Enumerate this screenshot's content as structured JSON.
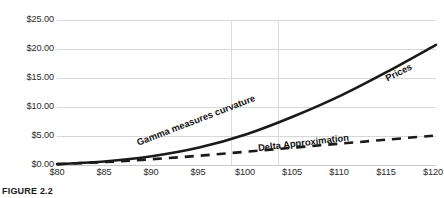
{
  "chart_data": {
    "type": "line",
    "title": "",
    "subtitle": "",
    "xlabel": "",
    "ylabel": "",
    "xlim": [
      80,
      120
    ],
    "ylim": [
      0,
      25
    ],
    "grid": true,
    "legend_position": "inline-along-curves",
    "x_tick_labels": [
      "$80",
      "$85",
      "$90",
      "$95",
      "$100",
      "$105",
      "$110",
      "$115",
      "$120"
    ],
    "x_tick_values": [
      80,
      85,
      90,
      95,
      100,
      105,
      110,
      115,
      120
    ],
    "y_tick_labels": [
      "$0.00",
      "$5.00",
      "$10.00",
      "$15.00",
      "$20.00",
      "$25.00"
    ],
    "y_tick_values": [
      0,
      5,
      10,
      15,
      20,
      25
    ],
    "x": [
      80,
      85,
      90,
      95,
      100,
      105,
      110,
      115,
      120
    ],
    "series": [
      {
        "name": "Prices",
        "style": "solid",
        "color": "#1a1a1a",
        "width": 2.6,
        "values": [
          0.15,
          0.6,
          1.5,
          3.0,
          5.3,
          8.4,
          12.0,
          16.2,
          20.7
        ]
      },
      {
        "name": "Delta Approximation",
        "style": "dashed",
        "color": "#1a1a1a",
        "width": 2.6,
        "values": [
          0.15,
          0.5,
          1.0,
          1.6,
          2.3,
          3.0,
          3.7,
          4.4,
          5.1
        ]
      }
    ],
    "annotations": [
      {
        "text": "Gamma measures curvature",
        "rotation": -21
      },
      {
        "text": "Delta Approximation",
        "rotation": -6.5
      },
      {
        "text": "Prices",
        "rotation": -27
      }
    ],
    "colors": {
      "line": "#1a1a1a",
      "gridline": "#d8d8da",
      "text": "#2b2b2b",
      "background": "#ffffff"
    }
  },
  "caption": {
    "text": "FIGURE 2.2"
  }
}
